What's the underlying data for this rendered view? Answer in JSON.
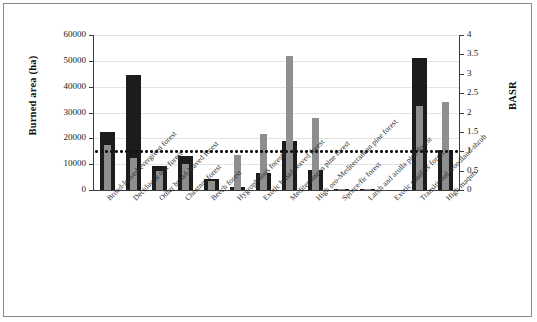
{
  "chart_data": {
    "type": "bar",
    "title": "",
    "xlabel": "",
    "ylabel": "Burned area (ha)",
    "y2label": "BASR",
    "ylim": [
      0,
      60000
    ],
    "y2lim": [
      0,
      4
    ],
    "grid": true,
    "legend_position": "none",
    "y_ticks": [
      "0",
      "10000",
      "20000",
      "30000",
      "40000",
      "50000",
      "60000"
    ],
    "y2_ticks": [
      "0",
      "0.5",
      "1",
      "1.5",
      "2",
      "2.5",
      "3",
      "3.5",
      "4"
    ],
    "annotations": [
      {
        "name": "basr-threshold",
        "type": "horizontal-dotted-line",
        "axis": "right",
        "value": 1
      }
    ],
    "categories": [
      "Broad-leaved evergreen forest",
      "Deciduous oak forest",
      "Other broad-leaved forest",
      "Chestnut forest",
      "Beech forest",
      "Hygrophilous forests",
      "Exotic broad-leaved forest",
      "Mediterranean pine forest",
      "High oro-Mediterranean pine forest",
      "Spruce/fir forest",
      "Larch and arolla pine forest",
      "Exotic conifers forest",
      "Transitional woodland-shrub",
      "High maquis"
    ],
    "series": [
      {
        "name": "Burned area (ha)",
        "axis": "left",
        "color": "#1c1c1c",
        "values": [
          22500,
          44500,
          9300,
          13200,
          4300,
          1200,
          6400,
          19000,
          7900,
          300,
          250,
          0,
          51000,
          15500
        ]
      },
      {
        "name": "BASR",
        "axis": "right",
        "color": "#8e8e8e",
        "values": [
          1.15,
          0.82,
          0.48,
          0.68,
          0.22,
          0.9,
          1.45,
          3.45,
          1.87,
          0.03,
          0.02,
          0.0,
          2.17,
          2.28
        ]
      }
    ]
  }
}
